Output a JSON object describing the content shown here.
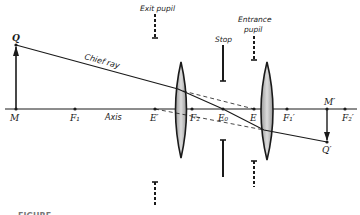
{
  "diagram": {
    "type": "optical-system-pupils",
    "colors": {
      "ink": "#1a1a1a",
      "lens_fill": "#c8c8c8",
      "background": "#ffffff"
    },
    "labels": {
      "object_top": "Q",
      "object_base": "M",
      "focal_1": "F₁",
      "axis": "Axis",
      "exit_pupil_center": "E′",
      "focal_2": "F₂",
      "stop_center": "E₀",
      "entrance_pupil_center": "E",
      "focal_1_prime": "F₁′",
      "image_base": "M′",
      "focal_2_prime": "F₂′",
      "image_top": "Q′",
      "chief_ray": "Chief ray",
      "exit_pupil": "Exit pupil",
      "stop": "Stop",
      "entrance_pupil_line1": "Entrance",
      "entrance_pupil_line2": "pupil",
      "figure_caption": "FIGURE"
    }
  }
}
